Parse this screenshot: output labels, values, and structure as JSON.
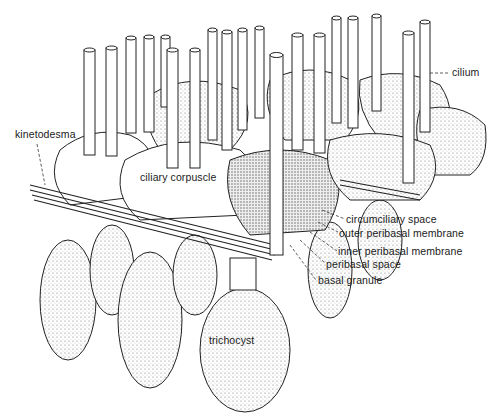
{
  "figure": {
    "labels": {
      "cilium": "cilium",
      "kinetodesma": "kinetodesma",
      "ciliary_corpuscle": "ciliary corpuscle",
      "circumciliary_space": "circumciliary space",
      "outer_peribasal_membrane": "outer peribasal membrane",
      "inner_peribasal_membrane": "inner peribasal membrane",
      "peribasal_space": "peribasal space",
      "basal_granule": "basal granule",
      "trichocyst": "trichocyst"
    },
    "colors": {
      "ink": "#1a1a1a",
      "paper": "#ffffff",
      "shade": "#d9d9d9"
    }
  }
}
